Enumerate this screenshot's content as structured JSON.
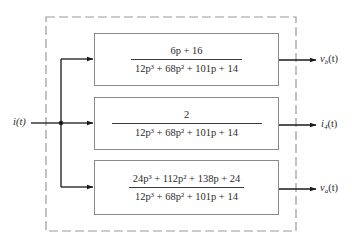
{
  "diagram": {
    "type": "block-diagram",
    "input": {
      "label": "i(t)"
    },
    "blocks": [
      {
        "id": "block-vb",
        "numerator": "6p + 16",
        "denominator": "12p³ + 68p² + 101p + 14",
        "output": {
          "symbol": "v",
          "subscript": "b",
          "arg": "(t)"
        }
      },
      {
        "id": "block-i4",
        "numerator": "2",
        "denominator": "12p³ + 68p² + 101p + 14",
        "output": {
          "symbol": "i",
          "subscript": "4",
          "arg": "(t)"
        }
      },
      {
        "id": "block-va",
        "numerator": "24p³ + 112p² + 138p + 24",
        "denominator": "12p³ + 68p² + 101p + 14",
        "output": {
          "symbol": "v",
          "subscript": "a",
          "arg": "(t)"
        }
      }
    ],
    "colors": {
      "line": "#1a1a1a",
      "block_border": "#8a8a8a",
      "dashed_border": "#9a9a9a",
      "text": "#2a2a2a",
      "background": "#ffffff"
    }
  }
}
